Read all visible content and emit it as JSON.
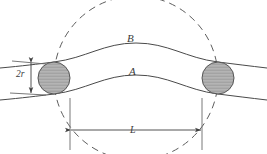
{
  "figure": {
    "kind": "engineering-diagram",
    "background_color": "#ffffff",
    "line_color": "#4a4a4a",
    "dashed_color": "#5a5a5a",
    "circle_fill": "#b0b0b0",
    "circle_stroke": "#555555",
    "hatch_color": "#8f8f8f",
    "labels": {
      "curve_upper": "B",
      "curve_lower": "A",
      "span": "L",
      "diameter": "2r"
    },
    "geometry": {
      "small_circle_radius": 16,
      "small_circle_left_center": [
        54,
        78
      ],
      "small_circle_right_center": [
        218,
        78
      ],
      "large_dashed_circle_center": [
        136,
        78
      ],
      "large_dashed_circle_radius": 82,
      "dimension_line_y": 130,
      "extension_line_left_x": 70,
      "extension_line_right_x": 202,
      "diameter_arrow_x": 31,
      "diameter_arrow_top_y": 62,
      "diameter_arrow_bottom_y": 94
    }
  }
}
